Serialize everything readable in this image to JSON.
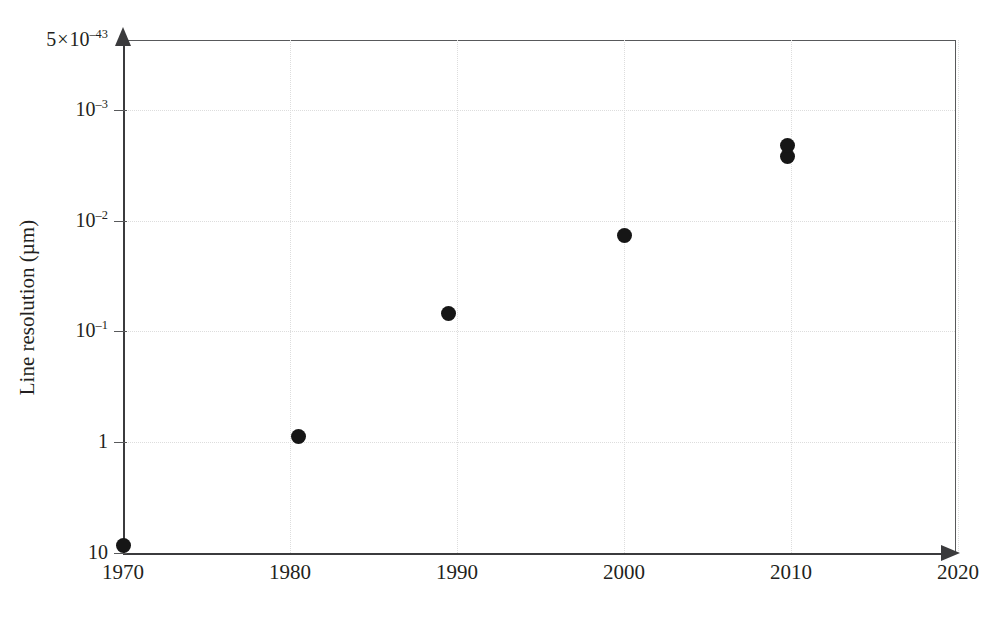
{
  "chart_data": {
    "type": "scatter",
    "title": "",
    "xlabel": "",
    "ylabel": "Line resolution (µm)",
    "grid": true,
    "legend": null,
    "y_axis_inverted": true,
    "y_scale": "log",
    "xlim": [
      1970,
      2023
    ],
    "ylim_top_label": "5×10⁻⁴³",
    "x_ticks": [
      {
        "value": 1970,
        "label": "1970"
      },
      {
        "value": 1980,
        "label": "1980"
      },
      {
        "value": 1990,
        "label": "1990"
      },
      {
        "value": 2000,
        "label": "2000"
      },
      {
        "value": 2010,
        "label": "2010"
      },
      {
        "value": 2020,
        "label": "2020"
      }
    ],
    "y_ticks": [
      {
        "mantissa": "5",
        "times": "×",
        "base": "10",
        "exp": "–43",
        "label": "5×10⁻⁴³",
        "value": 5e-43
      },
      {
        "mantissa": "",
        "times": "",
        "base": "10",
        "exp": "–3",
        "label": "10⁻³",
        "value": 0.001
      },
      {
        "mantissa": "",
        "times": "",
        "base": "10",
        "exp": "–2",
        "label": "10⁻²",
        "value": 0.01
      },
      {
        "mantissa": "",
        "times": "",
        "base": "10",
        "exp": "–1",
        "label": "10⁻¹",
        "value": 0.1
      },
      {
        "mantissa": "",
        "times": "",
        "base": "1",
        "exp": "",
        "label": "1",
        "value": 1
      },
      {
        "mantissa": "",
        "times": "",
        "base": "10",
        "exp": "",
        "label": "10",
        "value": 10
      }
    ],
    "x": [
      1970,
      1980.5,
      1989.5,
      2000,
      2009.8,
      2009.8
    ],
    "y": [
      8.5,
      0.88,
      0.068,
      0.0135,
      0.0026,
      0.0021
    ],
    "points": [
      {
        "x": 1970,
        "y": 8.5,
        "label": "1970"
      },
      {
        "x": 1980.5,
        "y": 0.88,
        "label": "1980"
      },
      {
        "x": 1989.5,
        "y": 0.068,
        "label": "1990"
      },
      {
        "x": 2000,
        "y": 0.0135,
        "label": "2000"
      },
      {
        "x": 2009.8,
        "y": 0.0026,
        "label": "2010"
      },
      {
        "x": 2009.8,
        "y": 0.0021,
        "label": "2010"
      }
    ],
    "marker_color": "#161616",
    "axis_color": "#3b3b3d",
    "grid_color": "#dddddd"
  }
}
